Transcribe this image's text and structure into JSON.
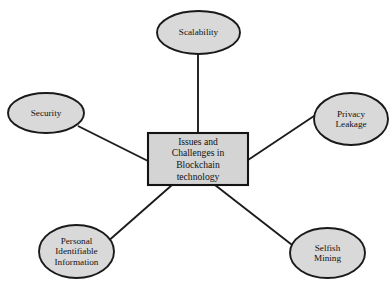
{
  "diagram": {
    "type": "radial-hub-and-spoke",
    "background_color": "#ffffff",
    "shape_fill_color": "#d9d9d9",
    "shape_stroke_color": "#1a1a1a",
    "center": {
      "label": "Issues and\nChallenges in\nBlockchain\ntechnology",
      "shape": "rectangle"
    },
    "nodes": [
      {
        "id": "scalability",
        "label": "Scalability",
        "shape": "ellipse",
        "position": "top"
      },
      {
        "id": "privacy-leakage",
        "label": "Privacy\nLeakage",
        "shape": "ellipse",
        "position": "right"
      },
      {
        "id": "selfish-mining",
        "label": "Selfish\nMining",
        "shape": "ellipse",
        "position": "bottom-right"
      },
      {
        "id": "personal-identifiable-information",
        "label": "Personal\nIdentifiable\nInformation",
        "shape": "ellipse",
        "position": "bottom-left"
      },
      {
        "id": "security",
        "label": "Security",
        "shape": "ellipse",
        "position": "left"
      }
    ]
  }
}
